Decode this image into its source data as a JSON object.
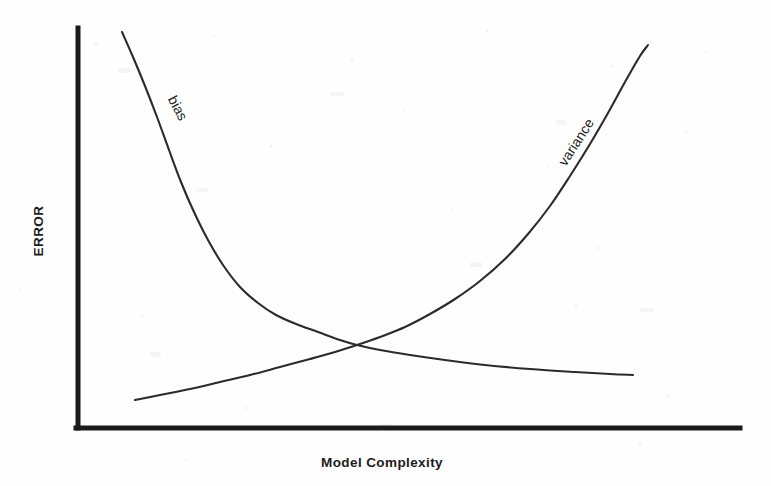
{
  "figure": {
    "width": 771,
    "height": 486,
    "background_color": "#fefefe",
    "ink_color": "#2b2b2b",
    "axis_color": "#1a1a1a"
  },
  "axes": {
    "y_title": "ERROR",
    "x_title": "Model Complexity",
    "y_axis_x_px": 78,
    "y_axis_top_px": 28,
    "y_axis_bottom_px": 428,
    "x_axis_y_px": 428,
    "x_axis_left_px": 78,
    "x_axis_right_px": 740,
    "ticks_shown": false,
    "tick_labels": [],
    "gridlines": false
  },
  "labels": {
    "bias": "bias",
    "variance": "variance"
  },
  "chart_data": {
    "type": "line",
    "title": "",
    "subtitle": "",
    "xlabel": "Model Complexity",
    "ylabel": "ERROR",
    "xlim": [
      0,
      1
    ],
    "ylim": [
      0,
      1
    ],
    "grid": false,
    "legend": "inline-curve-labels",
    "axis_tick_labels": [],
    "annotations": [
      {
        "text": "bias",
        "attached_to": "bias",
        "x_px": 178,
        "y_px": 108,
        "rotation_deg": 62
      },
      {
        "text": "variance",
        "attached_to": "variance",
        "x_px": 576,
        "y_px": 142,
        "rotation_deg": -57
      }
    ],
    "crossing_point_px": {
      "x": 357,
      "y": 345
    },
    "series": [
      {
        "name": "bias",
        "shape": "monotonic-decreasing-convex",
        "description": "High error at low model complexity, decays steeply then flattens toward a low asymptote.",
        "points_px": [
          [
            122,
            32
          ],
          [
            133,
            57
          ],
          [
            145,
            86
          ],
          [
            157,
            117
          ],
          [
            169,
            150
          ],
          [
            181,
            182
          ],
          [
            194,
            212
          ],
          [
            208,
            240
          ],
          [
            223,
            265
          ],
          [
            240,
            287
          ],
          [
            258,
            303
          ],
          [
            276,
            315
          ],
          [
            296,
            324
          ],
          [
            318,
            332
          ],
          [
            340,
            340
          ],
          [
            357,
            345
          ],
          [
            380,
            350
          ],
          [
            410,
            355
          ],
          [
            445,
            360
          ],
          [
            485,
            365
          ],
          [
            530,
            369
          ],
          [
            575,
            372
          ],
          [
            610,
            374
          ],
          [
            633,
            375
          ]
        ],
        "x_norm": [
          0.066,
          0.083,
          0.101,
          0.119,
          0.137,
          0.155,
          0.175,
          0.196,
          0.219,
          0.245,
          0.272,
          0.299,
          0.329,
          0.362,
          0.396,
          0.421,
          0.456,
          0.502,
          0.554,
          0.615,
          0.683,
          0.751,
          0.804,
          0.839
        ],
        "y_norm": [
          0.99,
          0.928,
          0.855,
          0.778,
          0.695,
          0.615,
          0.54,
          0.47,
          0.408,
          0.353,
          0.313,
          0.283,
          0.26,
          0.24,
          0.22,
          0.208,
          0.195,
          0.183,
          0.17,
          0.158,
          0.148,
          0.14,
          0.135,
          0.133
        ]
      },
      {
        "name": "variance",
        "shape": "monotonic-increasing-convex",
        "description": "Low error at low model complexity, rises slowly then accelerates sharply at high complexity.",
        "points_px": [
          [
            135,
            400
          ],
          [
            160,
            395
          ],
          [
            190,
            389
          ],
          [
            220,
            382
          ],
          [
            250,
            375
          ],
          [
            280,
            367
          ],
          [
            310,
            359
          ],
          [
            335,
            352
          ],
          [
            357,
            345
          ],
          [
            380,
            337
          ],
          [
            405,
            327
          ],
          [
            430,
            314
          ],
          [
            455,
            299
          ],
          [
            480,
            281
          ],
          [
            505,
            259
          ],
          [
            528,
            234
          ],
          [
            550,
            206
          ],
          [
            570,
            176
          ],
          [
            590,
            144
          ],
          [
            608,
            113
          ],
          [
            625,
            82
          ],
          [
            640,
            56
          ],
          [
            648,
            45
          ]
        ],
        "x_norm": [
          0.086,
          0.124,
          0.169,
          0.214,
          0.26,
          0.305,
          0.35,
          0.388,
          0.421,
          0.456,
          0.494,
          0.532,
          0.57,
          0.607,
          0.645,
          0.68,
          0.713,
          0.743,
          0.773,
          0.8,
          0.826,
          0.849,
          0.861
        ],
        "y_norm": [
          0.07,
          0.083,
          0.098,
          0.115,
          0.133,
          0.153,
          0.173,
          0.19,
          0.208,
          0.228,
          0.253,
          0.285,
          0.323,
          0.368,
          0.423,
          0.485,
          0.555,
          0.63,
          0.71,
          0.788,
          0.865,
          0.93,
          0.958
        ]
      }
    ]
  }
}
